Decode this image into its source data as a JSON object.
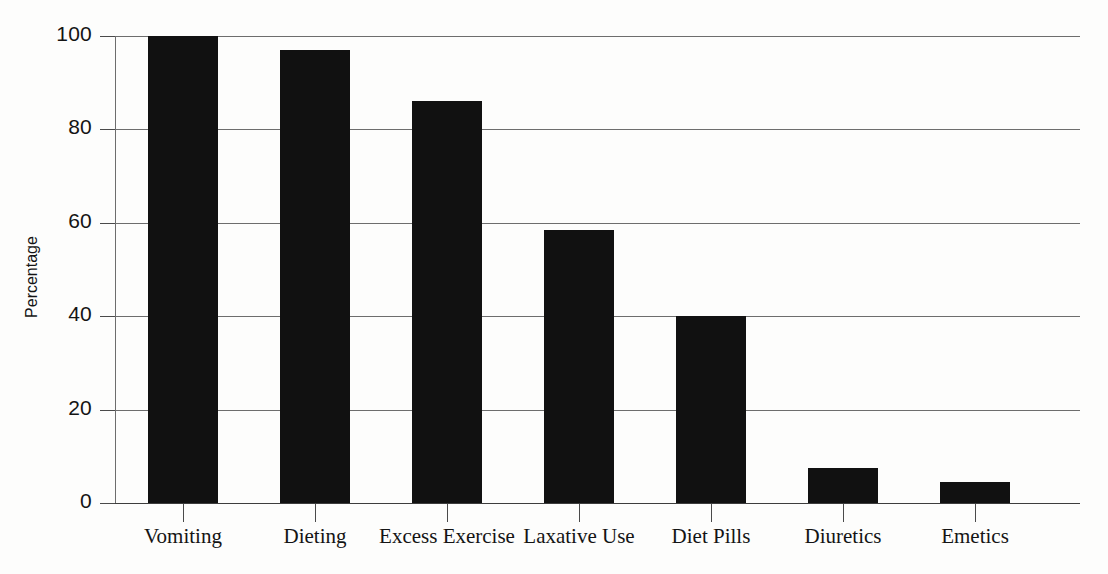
{
  "chart_data": {
    "type": "bar",
    "title": "",
    "xlabel": "",
    "ylabel": "Percentage",
    "ylim": [
      0,
      100
    ],
    "ytick_values": [
      0,
      20,
      40,
      60,
      80,
      100
    ],
    "ytick_labels": [
      "0",
      "20",
      "40",
      "60",
      "80",
      "100"
    ],
    "grid": true,
    "legend": "none",
    "bar_color": "#111111",
    "axis_color": "#4a4a4a",
    "categories": [
      "Vomiting",
      "Dieting",
      "Excess Exercise",
      "Laxative Use",
      "Diet Pills",
      "Diuretics",
      "Emetics"
    ],
    "values": [
      100,
      97,
      86,
      58.5,
      40,
      7.5,
      4.5
    ]
  }
}
